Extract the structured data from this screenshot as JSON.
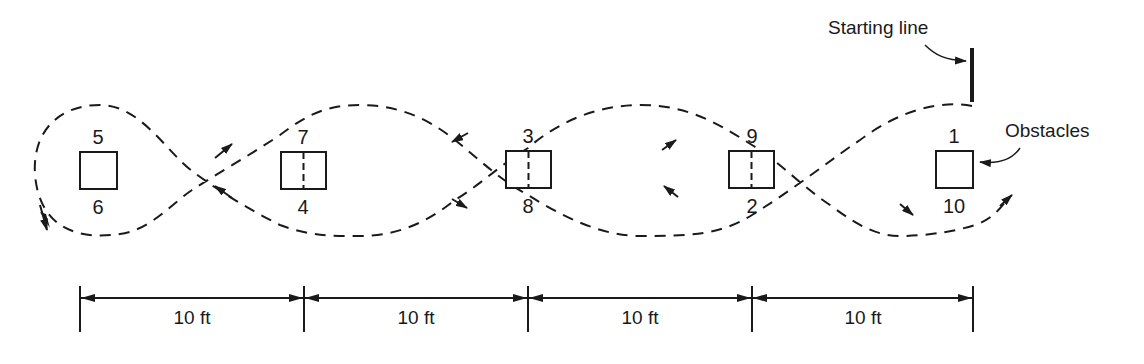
{
  "diagram": {
    "type": "obstacle-course-path",
    "colors": {
      "ink": "#1a1a1a",
      "background": "#ffffff"
    },
    "callouts": {
      "starting_line": "Starting line",
      "obstacles": "Obstacles"
    },
    "obstacles": [
      {
        "id": "obstacle-1",
        "top_label": "5",
        "bottom_label": "6",
        "divided": false
      },
      {
        "id": "obstacle-2",
        "top_label": "7",
        "bottom_label": "4",
        "divided": true
      },
      {
        "id": "obstacle-3",
        "top_label": "3",
        "bottom_label": "8",
        "divided": true
      },
      {
        "id": "obstacle-4",
        "top_label": "9",
        "bottom_label": "2",
        "divided": true
      },
      {
        "id": "obstacle-5",
        "top_label": "1",
        "bottom_label": "10",
        "divided": false
      }
    ],
    "dimensions": [
      {
        "label": "10 ft"
      },
      {
        "label": "10 ft"
      },
      {
        "label": "10 ft"
      },
      {
        "label": "10 ft"
      }
    ],
    "path": {
      "style": "dashed",
      "arrows": "direction-of-travel"
    }
  }
}
